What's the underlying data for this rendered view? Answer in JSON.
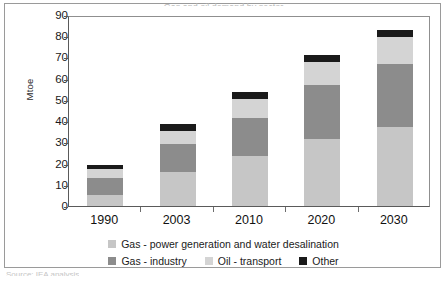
{
  "figure": {
    "title": "Gas and oil demand by sector",
    "source_caption": "Source: IEA analysis"
  },
  "chart_data": {
    "type": "bar",
    "subtype": "stacked",
    "title": "Gas and oil demand by sector",
    "xlabel": "",
    "ylabel": "Mtoe",
    "ylim": [
      0,
      90
    ],
    "ytick_step": 10,
    "yticks": [
      90,
      80,
      70,
      60,
      50,
      40,
      30,
      20,
      10,
      0
    ],
    "grid": false,
    "legend_position": "bottom",
    "categories": [
      "1990",
      "2003",
      "2010",
      "2020",
      "2030"
    ],
    "series": [
      {
        "name": "Gas - power generation and water desalination",
        "color": "#c6c6c6",
        "values": [
          5.0,
          16.0,
          23.5,
          31.5,
          37.0
        ]
      },
      {
        "name": "Gas - industry",
        "color": "#8c8c8c",
        "values": [
          8.0,
          13.0,
          18.0,
          25.5,
          30.0
        ]
      },
      {
        "name": "Oil - transport",
        "color": "#d4d4d4",
        "values": [
          4.5,
          6.5,
          9.0,
          11.0,
          12.5
        ]
      },
      {
        "name": "Other",
        "color": "#1a1a1a",
        "values": [
          2.0,
          3.0,
          3.0,
          3.0,
          3.5
        ]
      }
    ],
    "totals": [
      19.5,
      38.5,
      53.5,
      71.0,
      83.0
    ]
  },
  "legend": {
    "rows": [
      [
        {
          "label": "Gas - power generation and water desalination",
          "color": "#c6c6c6"
        }
      ],
      [
        {
          "label": "Gas - industry",
          "color": "#8c8c8c"
        },
        {
          "label": "Oil - transport",
          "color": "#d4d4d4"
        },
        {
          "label": "Other",
          "color": "#1a1a1a"
        }
      ]
    ]
  }
}
